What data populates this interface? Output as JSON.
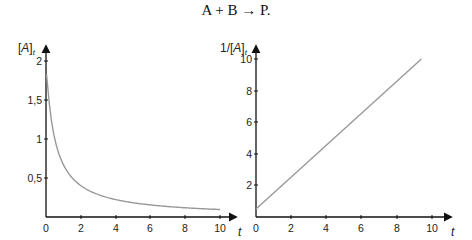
{
  "title": "A + B → P.",
  "chart_data": [
    {
      "type": "line",
      "title": "",
      "xlabel": "t",
      "ylabel": "[A]_t",
      "xlim": [
        0,
        10
      ],
      "ylim": [
        0,
        2
      ],
      "x_ticks": [
        "0",
        "2",
        "4",
        "6",
        "8",
        "10"
      ],
      "y_ticks": [
        "0,5",
        "1",
        "1,5",
        "2"
      ],
      "grid": false,
      "color": "#999999",
      "measured_points": [
        {
          "t": 2,
          "value": 0.4
        },
        {
          "t": 10,
          "value": 0.1
        }
      ],
      "measured_start_value": "approx. 1.8-2.0 (top of curve cut by the y-axis arrow; exact start unclear)",
      "interpretation": {
        "description": "Curve shape consistent with second-order decay [A](t) = 2/(1+2t), i.e. [A]0 = 2 and k = 1. This model fits the measured t=2 and t=10 points and the right chart's line, but model values are not read from the image.",
        "model_series": {
          "x": [
            0,
            0.25,
            0.5,
            0.75,
            1,
            1.5,
            2,
            3,
            4,
            5,
            6,
            7,
            8,
            9,
            10
          ],
          "values": [
            2.0,
            1.333,
            1.0,
            0.8,
            0.667,
            0.5,
            0.4,
            0.286,
            0.222,
            0.182,
            0.154,
            0.133,
            0.118,
            0.105,
            0.095
          ]
        }
      }
    },
    {
      "type": "line",
      "title": "",
      "xlabel": "t",
      "ylabel": "1/[A]_t",
      "xlim": [
        0,
        10
      ],
      "ylim": [
        0,
        10
      ],
      "x_ticks": [
        "0",
        "2",
        "4",
        "6",
        "8",
        "10"
      ],
      "y_ticks": [
        "2",
        "4",
        "6",
        "8",
        "10"
      ],
      "grid": false,
      "color": "#999999",
      "x": [
        0,
        9.4
      ],
      "values": [
        0.5,
        10
      ],
      "notes": "Straight line from (0, 0.5) to approx. (9.4, 10); slope approx. 1.0"
    }
  ],
  "left_chart": {
    "ylabel": "[A]",
    "ylabel_sub": "t",
    "xlabel": "t",
    "x_ticks": [
      "0",
      "2",
      "4",
      "6",
      "8",
      "10"
    ],
    "y_ticks": [
      "0,5",
      "1",
      "1,5",
      "2"
    ]
  },
  "right_chart": {
    "ylabel": "1/[A]",
    "ylabel_sub": "t",
    "xlabel": "t",
    "x_ticks": [
      "0",
      "2",
      "4",
      "6",
      "8",
      "10"
    ],
    "y_ticks": [
      "2",
      "4",
      "6",
      "8",
      "10"
    ]
  }
}
